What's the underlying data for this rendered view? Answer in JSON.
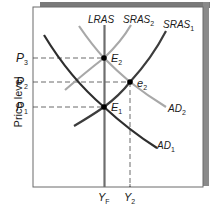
{
  "diagram": {
    "type": "aggregate demand / aggregate supply",
    "y_axis_label": "Price level",
    "price_levels": [
      {
        "name": "P",
        "sub": "3",
        "y": 58
      },
      {
        "name": "P",
        "sub": "2",
        "y": 82
      },
      {
        "name": "P",
        "sub": "1",
        "y": 107
      }
    ],
    "output_levels": [
      {
        "name": "Y",
        "sub": "F",
        "x": 104
      },
      {
        "name": "Y",
        "sub": "2",
        "x": 130
      }
    ],
    "curves": [
      {
        "name": "LRAS",
        "sub": "",
        "color": "#6e6e6e"
      },
      {
        "name": "SRAS",
        "sub": "2",
        "color": "#a8a8a8"
      },
      {
        "name": "SRAS",
        "sub": "1",
        "color": "#3c3c3c"
      },
      {
        "name": "AD",
        "sub": "2",
        "color": "#a8a8a8"
      },
      {
        "name": "AD",
        "sub": "1",
        "color": "#2e2e2e"
      }
    ],
    "points": [
      {
        "name": "E",
        "sub": "2",
        "x": 104,
        "y": 58
      },
      {
        "name": "e",
        "sub": "2",
        "x": 130,
        "y": 82
      },
      {
        "name": "E",
        "sub": "1",
        "x": 104,
        "y": 107
      }
    ],
    "colors": {
      "frame": "#6a6a6a",
      "shadow": "#7a7a7a",
      "dark_curve": "#2e2e2e",
      "light_curve": "#a8a8a8",
      "lras": "#6e6e6e",
      "dashed": "#444444",
      "point": "#000000"
    }
  }
}
